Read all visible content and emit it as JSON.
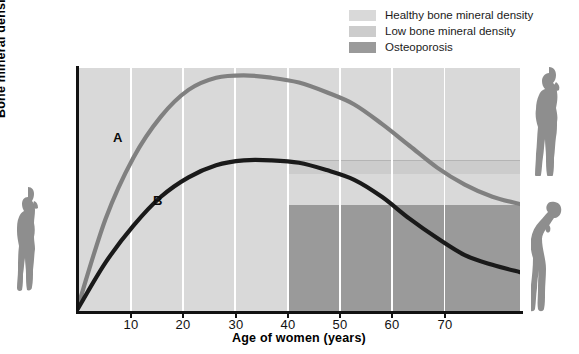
{
  "legend": {
    "items": [
      {
        "label": "Healthy bone mineral density",
        "color": "#d9d9d9",
        "name": "legend-healthy"
      },
      {
        "label": "Low bone mineral density",
        "color": "#cccccc",
        "name": "legend-low"
      },
      {
        "label": "Osteoporosis",
        "color": "#9a9a9a",
        "name": "legend-osteoporosis"
      }
    ]
  },
  "axes": {
    "xlabel": "Age of women (years)",
    "ylabel": "Bone mineral density",
    "xticks": [
      "10",
      "20",
      "30",
      "40",
      "50",
      "60",
      "70"
    ]
  },
  "curves": {
    "a_label": "A",
    "b_label": "B"
  },
  "figures": {
    "left": "standing-woman-silhouette",
    "top_right": "standing-woman-silhouette",
    "bottom_right": "stooped-woman-silhouette"
  },
  "chart_data": {
    "type": "line",
    "title": "",
    "xlabel": "Age of women (years)",
    "ylabel": "Bone mineral density",
    "xlim": [
      0,
      80
    ],
    "ylim": [
      0,
      100
    ],
    "xticks": [
      10,
      20,
      30,
      40,
      50,
      60,
      70
    ],
    "yticks": [],
    "grid": "vertical-white-gridlines-at-xticks",
    "legend_position": "top-right-outside",
    "bands": [
      {
        "name": "Healthy bone mineral density",
        "color": "#d9d9d9",
        "x_range": [
          0,
          80
        ],
        "y_range": [
          0,
          100
        ]
      },
      {
        "name": "Low bone mineral density",
        "color": "#cccccc",
        "x_range": [
          30,
          80
        ],
        "y_range": [
          43,
          62
        ]
      },
      {
        "name": "Osteoporosis",
        "color": "#9a9a9a",
        "x_range": [
          30,
          80
        ],
        "y_range": [
          0,
          43
        ]
      }
    ],
    "series": [
      {
        "name": "A",
        "description": "Normal peak bone mass; remains above osteoporosis threshold",
        "color": "#808080",
        "x": [
          0,
          5,
          10,
          15,
          20,
          25,
          30,
          35,
          40,
          45,
          50,
          55,
          60,
          65,
          70,
          75,
          80
        ],
        "y": [
          2,
          38,
          63,
          80,
          91,
          96,
          97,
          96,
          94,
          90,
          85,
          77,
          68,
          59,
          52,
          47,
          44
        ]
      },
      {
        "name": "B",
        "description": "Low peak bone mass; falls into osteoporosis range after menopause",
        "color": "#1a1a1a",
        "x": [
          0,
          5,
          10,
          15,
          20,
          25,
          30,
          35,
          40,
          45,
          50,
          55,
          60,
          65,
          70,
          75,
          80
        ],
        "y": [
          1,
          20,
          35,
          47,
          55,
          60,
          62,
          62,
          61,
          58,
          54,
          47,
          38,
          30,
          23,
          19,
          16
        ]
      }
    ]
  }
}
